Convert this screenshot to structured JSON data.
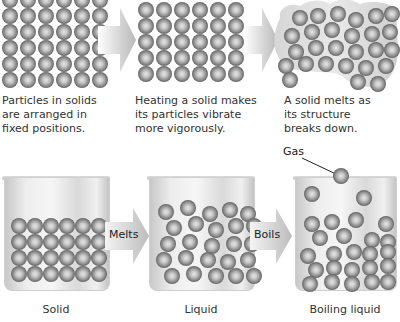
{
  "top_row": {
    "panels": [
      {
        "caption": "Particles in solids are arranged in fixed positions.",
        "lines": [
          "Particles in solids",
          "are arranged in",
          "fixed positions."
        ]
      },
      {
        "caption": "Heating a solid makes its particles vibrate more vigorously.",
        "lines": [
          "Heating a solid makes",
          "its particles vibrate",
          "more vigorously."
        ]
      },
      {
        "caption": "A solid melts as its structure breaks down.",
        "lines": [
          "A solid melts as",
          "its structure",
          "breaks down."
        ]
      }
    ]
  },
  "bottom_row": {
    "beakers": [
      {
        "label": "Solid"
      },
      {
        "label": "Liquid"
      },
      {
        "label": "Boiling liquid"
      }
    ],
    "arrows": [
      {
        "label": "Melts"
      },
      {
        "label": "Boils"
      }
    ],
    "gas_label": "Gas"
  },
  "colors": {
    "particle_dark": "#2e2e2e",
    "particle_light": "#e6e6e6",
    "arrow_gray": "#bdbdbd",
    "text": "#333333"
  }
}
